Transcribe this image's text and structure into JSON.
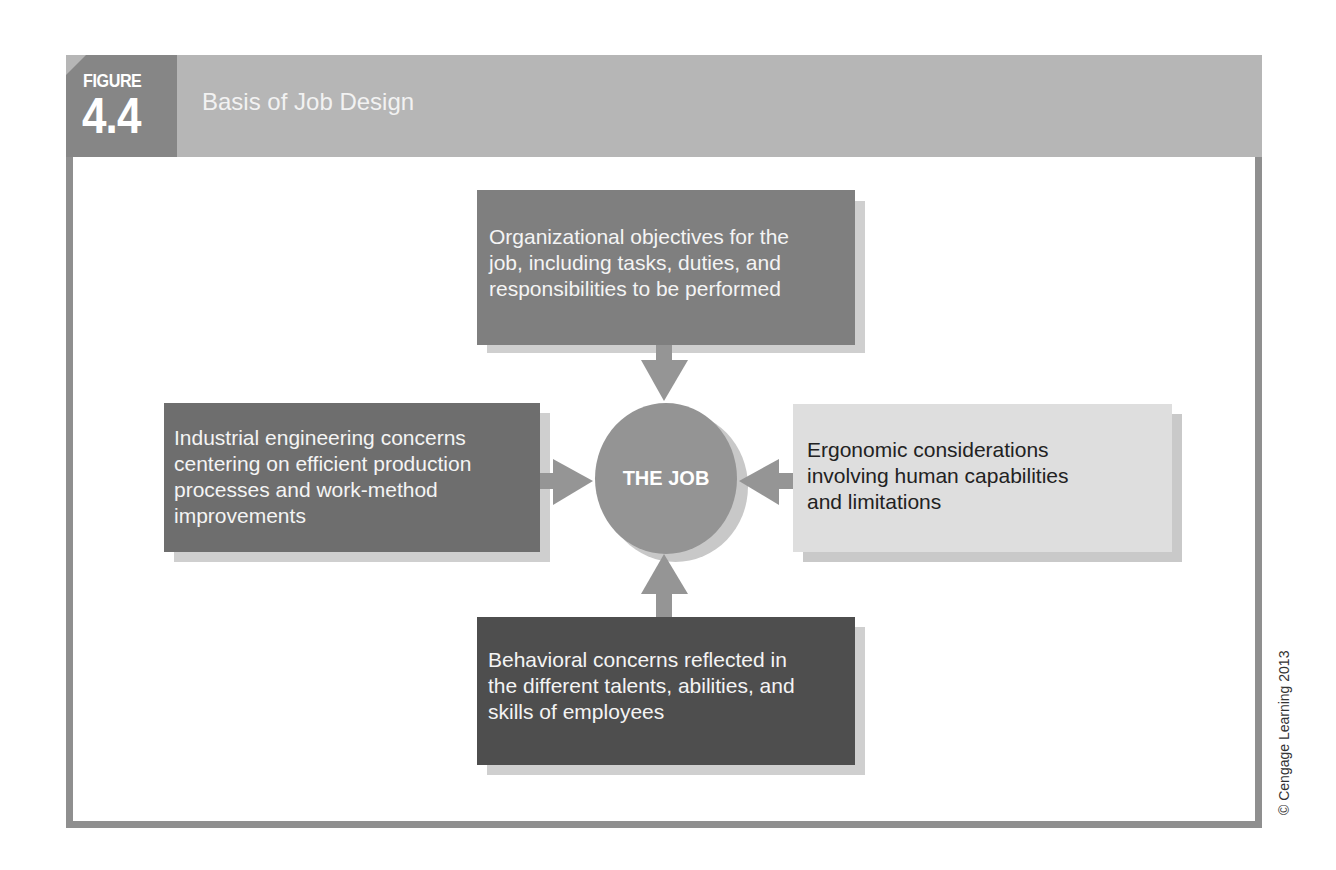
{
  "figure": {
    "label": "FIGURE",
    "number": "4.4",
    "title": "Basis of Job Design"
  },
  "diagram": {
    "center": {
      "label": "THE JOB"
    },
    "nodes": {
      "top": {
        "text": "Organizational objectives for the job, including tasks, duties, and responsibilities to be performed",
        "lines": [
          "Organizational objectives for the",
          "job, including tasks, duties, and",
          "responsibilities to be performed"
        ]
      },
      "left": {
        "text": "Industrial engineering concerns centering on efficient production processes and work-method improvements",
        "lines": [
          "Industrial engineering concerns",
          "centering on efficient production",
          "processes and work-method",
          "improvements"
        ]
      },
      "right": {
        "text": "Ergonomic considerations involving human capabilities and limitations",
        "lines": [
          "Ergonomic considerations",
          "involving human capabilities",
          "and limitations"
        ]
      },
      "bottom": {
        "text": "Behavioral concerns reflected in the different talents, abilities, and skills of employees",
        "lines": [
          "Behavioral concerns reflected in",
          "the different talents, abilities, and",
          "skills of employees"
        ]
      }
    },
    "edges": [
      {
        "from": "top",
        "to": "center"
      },
      {
        "from": "left",
        "to": "center"
      },
      {
        "from": "right",
        "to": "center"
      },
      {
        "from": "bottom",
        "to": "center"
      }
    ],
    "colors": {
      "header": "#b6b6b6",
      "label_block": "#868686",
      "frame": "#8f8f8f",
      "top_box": "#7f7f7f",
      "left_box": "#6e6e6e",
      "right_box": "#dedede",
      "bottom_box": "#4e4e4e",
      "circle": "#949494",
      "arrow": "#959595"
    }
  },
  "copyright": "© Cengage Learning 2013"
}
